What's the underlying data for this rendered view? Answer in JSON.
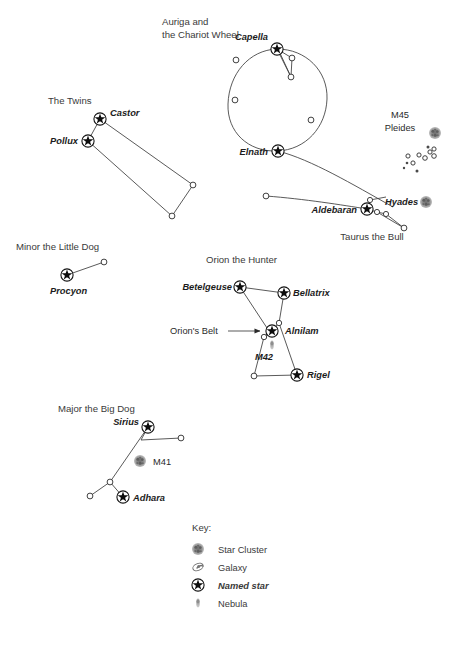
{
  "figure": {
    "type": "star-chart",
    "title_visible": false,
    "background_color": "#ffffff",
    "ink_color": "#3a3a3a",
    "cluster_color": "#808080",
    "nebula_color": "#9a9a9a"
  },
  "constellations": [
    {
      "id": "auriga",
      "title": "Auriga and",
      "title_line2": "the Chariot Wheel",
      "title_x": 162,
      "title_y": 25,
      "title_line2_y": 38,
      "named_stars": [
        {
          "name": "Capella",
          "x": 277,
          "y": 49,
          "label_x": 253,
          "label_y": 40,
          "label_anchor": "end"
        },
        {
          "name": "Elnath",
          "x": 278,
          "y": 151,
          "label_x": 263,
          "label_y": 155,
          "label_anchor": "end"
        }
      ],
      "plain_stars": [
        {
          "x": 236,
          "y": 60
        },
        {
          "x": 235,
          "y": 100
        },
        {
          "x": 292,
          "y": 58
        },
        {
          "x": 291,
          "y": 76
        },
        {
          "x": 311,
          "y": 120
        }
      ]
    },
    {
      "id": "gemini",
      "title": "The Twins",
      "title_x": 48,
      "title_y": 104,
      "named_stars": [
        {
          "name": "Castor",
          "x": 100,
          "y": 119,
          "label_x": 112,
          "label_y": 116,
          "label_anchor": "start"
        },
        {
          "name": "Pollux",
          "x": 88,
          "y": 141,
          "label_x": 76,
          "label_y": 144,
          "label_anchor": "end"
        }
      ],
      "plain_stars": [
        {
          "x": 193,
          "y": 185
        },
        {
          "x": 172,
          "y": 216
        }
      ]
    },
    {
      "id": "taurus",
      "title": "Taurus the Bull",
      "title_x": 372,
      "title_y": 238,
      "named_stars": [
        {
          "name": "Aldebaran",
          "x": 367,
          "y": 209,
          "label_x": 352,
          "label_y": 213,
          "label_anchor": "end"
        }
      ],
      "plain_stars": [
        {
          "x": 266,
          "y": 196
        },
        {
          "x": 377,
          "y": 212
        },
        {
          "x": 386,
          "y": 214
        },
        {
          "x": 370,
          "y": 200
        },
        {
          "x": 404,
          "y": 228
        }
      ]
    },
    {
      "id": "canis-minor",
      "title": "Minor the Little Dog",
      "title_x": 16,
      "title_y": 250,
      "named_stars": [
        {
          "name": "Procyon",
          "x": 67,
          "y": 275,
          "label_x": 52,
          "label_y": 293,
          "label_anchor": "start"
        }
      ],
      "plain_stars": [
        {
          "x": 104,
          "y": 262
        }
      ]
    },
    {
      "id": "orion",
      "title": "Orion the Hunter",
      "title_x": 206,
      "title_y": 263,
      "named_stars": [
        {
          "name": "Betelgeuse",
          "x": 240,
          "y": 287,
          "label_x": 235,
          "label_y": 290,
          "label_anchor": "end"
        },
        {
          "name": "Bellatrix",
          "x": 284,
          "y": 293,
          "label_x": 292,
          "label_y": 295,
          "label_anchor": "start"
        },
        {
          "name": "Alnilam",
          "x": 272,
          "y": 331,
          "label_x": 286,
          "label_y": 334,
          "label_anchor": "start"
        },
        {
          "name": "Rigel",
          "x": 297,
          "y": 375,
          "label_x": 306,
          "label_y": 378,
          "label_anchor": "start"
        }
      ],
      "plain_stars": [
        {
          "x": 279,
          "y": 323
        },
        {
          "x": 264,
          "y": 337
        },
        {
          "x": 254,
          "y": 376
        }
      ],
      "annotation": {
        "text": "Orion's Belt",
        "x": 170,
        "y": 334,
        "arrow_from_x": 228,
        "arrow_to_x": 259,
        "arrow_y": 331
      }
    },
    {
      "id": "canis-major",
      "title": "Major the Big Dog",
      "title_x": 58,
      "title_y": 412,
      "named_stars": [
        {
          "name": "Sirius",
          "x": 148,
          "y": 427,
          "label_x": 140,
          "label_y": 425,
          "label_anchor": "end"
        },
        {
          "name": "Adhara",
          "x": 123,
          "y": 497,
          "label_x": 133,
          "label_y": 501,
          "label_anchor": "start"
        }
      ],
      "plain_stars": [
        {
          "x": 181,
          "y": 438
        },
        {
          "x": 110,
          "y": 482
        },
        {
          "x": 90,
          "y": 496
        }
      ]
    }
  ],
  "deep_sky_objects": [
    {
      "id": "m45",
      "label_line1": "M45",
      "label_line2": "Pleides",
      "label_x": 400,
      "label_y1": 118,
      "label_y2": 131,
      "icon": "star-cluster-icon",
      "icon_x": 435,
      "icon_y": 133,
      "label_style": "plain"
    },
    {
      "id": "hyades",
      "label": "Hyades",
      "label_x": 385,
      "label_y": 205,
      "icon": "star-cluster-icon",
      "icon_x": 424,
      "icon_y": 202,
      "label_style": "italic"
    },
    {
      "id": "m41",
      "label": "M41",
      "label_x": 151,
      "label_y": 464,
      "icon": "star-cluster-icon",
      "icon_x": 139,
      "icon_y": 460,
      "label_style": "plain"
    },
    {
      "id": "m42",
      "label": "M42",
      "label_x": 264,
      "label_y": 357,
      "icon": "nebula-icon",
      "icon_x": 272,
      "icon_y": 344,
      "label_style": "italic"
    }
  ],
  "pleiades_dots": [
    {
      "x": 408,
      "y": 156,
      "r": 2.1,
      "filled": false
    },
    {
      "x": 407,
      "y": 162,
      "r": 1.3,
      "filled": true
    },
    {
      "x": 412,
      "y": 163,
      "r": 2.1,
      "filled": false
    },
    {
      "x": 418,
      "y": 155,
      "r": 2.1,
      "filled": false
    },
    {
      "x": 424,
      "y": 158,
      "r": 2.3,
      "filled": false
    },
    {
      "x": 429,
      "y": 151,
      "r": 2.1,
      "filled": false
    },
    {
      "x": 433,
      "y": 149,
      "r": 2.1,
      "filled": false
    },
    {
      "x": 433,
      "y": 155,
      "r": 2.3,
      "filled": false
    },
    {
      "x": 427,
      "y": 147,
      "r": 1.5,
      "filled": true
    },
    {
      "x": 416,
      "y": 171,
      "r": 1.5,
      "filled": true
    },
    {
      "x": 404,
      "y": 168,
      "r": 1.2,
      "filled": true
    }
  ],
  "key": {
    "title": "Key:",
    "title_x": 192,
    "title_y": 531,
    "items": [
      {
        "label": "Star Cluster",
        "icon": "star-cluster-icon",
        "style": "plain",
        "icon_x": 198,
        "icon_y": 549,
        "label_x": 218,
        "label_y": 552
      },
      {
        "label": "Galaxy",
        "icon": "galaxy-icon",
        "style": "plain",
        "icon_x": 198,
        "icon_y": 567,
        "label_x": 218,
        "label_y": 570
      },
      {
        "label": "Named star",
        "icon": "named-star-icon",
        "style": "italic",
        "icon_x": 198,
        "icon_y": 585,
        "label_x": 218,
        "label_y": 588
      },
      {
        "label": "Nebula",
        "icon": "nebula-icon",
        "style": "plain",
        "icon_x": 198,
        "icon_y": 603,
        "label_x": 218,
        "label_y": 606
      }
    ]
  }
}
